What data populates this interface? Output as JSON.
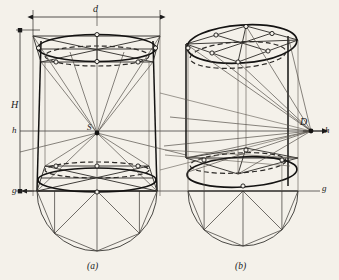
{
  "figure": {
    "background_color": "#f4f1ea",
    "ink_color": "#1a1a1a",
    "light_ink_color": "#55514c",
    "width": 339,
    "height": 280,
    "labels": {
      "diameter": "d",
      "height": "H",
      "horizon_left": "h",
      "horizon_right": "h",
      "ground_left": "g",
      "ground_right": "g",
      "station_point": "S",
      "distance_point": "D",
      "caption_a": "(a)",
      "caption_b": "(b)"
    },
    "panels": [
      {
        "id": "a",
        "caption": "(a)",
        "type": "one-point-perspective-cylinder",
        "center_x": 97,
        "top_ellipse_y": 45,
        "bottom_ellipse_y": 188,
        "semicircle_center_y": 193,
        "semicircle_radius": 60,
        "vanishing_point": {
          "x": 97,
          "y": 133,
          "label": "S"
        }
      },
      {
        "id": "b",
        "caption": "(b)",
        "type": "two-point-perspective-cylinder",
        "center_x": 243,
        "top_ellipse_y": 40,
        "bottom_ellipse_y": 185,
        "semicircle_center_y": 193,
        "semicircle_radius": 55,
        "vanishing_point": {
          "x": 311,
          "y": 131,
          "label": "D"
        }
      }
    ],
    "guides": {
      "horizon_line_y": 131,
      "ground_line_y": 191,
      "dimension_line_y": 17,
      "dimension_left_x": 33,
      "dimension_right_x": 160,
      "vertical_dim_x": 20,
      "vertical_dim_top_y": 30,
      "vertical_dim_bottom_y": 191
    }
  }
}
